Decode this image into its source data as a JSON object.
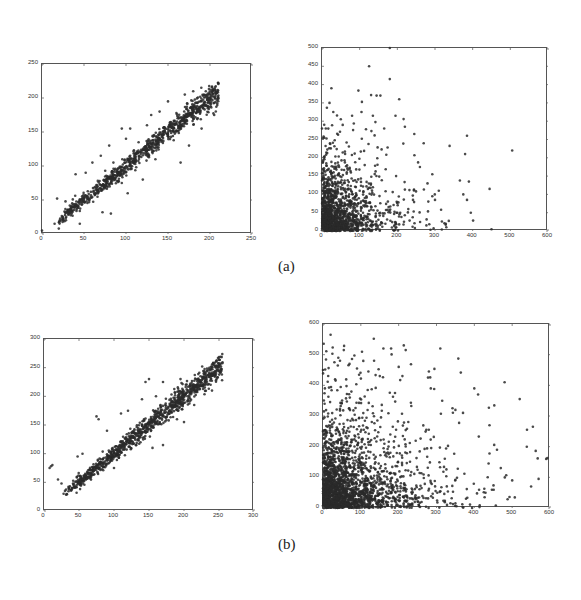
{
  "figure": {
    "captions": [
      "(a)",
      "(b)"
    ]
  },
  "chart_data": [
    {
      "id": "a-left",
      "type": "scatter",
      "title": "",
      "xlabel": "",
      "ylabel": "",
      "xlim": [
        0,
        250
      ],
      "ylim": [
        0,
        250
      ],
      "xticks": [
        0,
        50,
        100,
        150,
        200,
        250
      ],
      "yticks": [
        0,
        50,
        100,
        150,
        200,
        250
      ],
      "grid": false,
      "box": {
        "left": 41,
        "top": 63,
        "right": 251,
        "bottom": 233
      },
      "distribution": {
        "kind": "linear",
        "n": 900,
        "x_min": 20,
        "x_max": 210,
        "slope": 1.0,
        "intercept": 0,
        "noise": 6,
        "seed": 11
      },
      "outliers": [
        [
          0,
          5
        ],
        [
          15,
          15
        ],
        [
          20,
          8
        ],
        [
          18,
          52
        ],
        [
          28,
          48
        ],
        [
          40,
          88
        ],
        [
          45,
          15
        ],
        [
          52,
          90
        ],
        [
          60,
          105
        ],
        [
          70,
          115
        ],
        [
          72,
          32
        ],
        [
          80,
          130
        ],
        [
          82,
          30
        ],
        [
          85,
          105
        ],
        [
          95,
          75
        ],
        [
          95,
          155
        ],
        [
          100,
          140
        ],
        [
          102,
          60
        ],
        [
          105,
          155
        ],
        [
          115,
          135
        ],
        [
          120,
          80
        ],
        [
          125,
          160
        ],
        [
          135,
          110
        ],
        [
          130,
          175
        ],
        [
          140,
          180
        ],
        [
          150,
          195
        ],
        [
          165,
          105
        ],
        [
          170,
          205
        ],
        [
          175,
          130
        ],
        [
          180,
          210
        ],
        [
          190,
          155
        ],
        [
          195,
          210
        ],
        [
          205,
          175
        ],
        [
          210,
          200
        ]
      ]
    },
    {
      "id": "a-right",
      "type": "scatter",
      "title": "",
      "xlabel": "",
      "ylabel": "",
      "xlim": [
        0,
        600
      ],
      "ylim": [
        0,
        500
      ],
      "xticks": [
        0,
        100,
        200,
        300,
        400,
        500,
        600
      ],
      "yticks": [
        0,
        50,
        100,
        150,
        200,
        250,
        300,
        350,
        400,
        450,
        500
      ],
      "grid": false,
      "box": {
        "left": 321,
        "top": 47,
        "right": 547,
        "bottom": 230
      },
      "distribution": {
        "kind": "cluster",
        "n": 1400,
        "x_scale": 75,
        "y_scale": 80,
        "seed": 23
      },
      "outliers": [
        [
          0,
          280
        ],
        [
          10,
          280
        ],
        [
          20,
          350
        ],
        [
          25,
          390
        ],
        [
          30,
          325
        ],
        [
          55,
          290
        ],
        [
          80,
          315
        ],
        [
          105,
          325
        ],
        [
          125,
          450
        ],
        [
          135,
          315
        ],
        [
          145,
          370
        ],
        [
          155,
          370
        ],
        [
          165,
          280
        ],
        [
          180,
          415
        ],
        [
          180,
          500
        ],
        [
          195,
          315
        ],
        [
          205,
          360
        ],
        [
          220,
          285
        ],
        [
          245,
          265
        ],
        [
          260,
          175
        ],
        [
          270,
          240
        ],
        [
          280,
          130
        ],
        [
          300,
          85
        ],
        [
          310,
          110
        ],
        [
          330,
          10
        ],
        [
          375,
          100
        ],
        [
          380,
          210
        ],
        [
          385,
          260
        ],
        [
          385,
          85
        ],
        [
          390,
          135
        ],
        [
          395,
          50
        ],
        [
          445,
          115
        ],
        [
          450,
          5
        ],
        [
          505,
          220
        ]
      ]
    },
    {
      "id": "b-left",
      "type": "scatter",
      "title": "",
      "xlabel": "",
      "ylabel": "",
      "xlim": [
        0,
        300
      ],
      "ylim": [
        0,
        300
      ],
      "xticks": [
        0,
        50,
        100,
        150,
        200,
        250,
        300
      ],
      "yticks": [
        0,
        50,
        100,
        150,
        200,
        250,
        300
      ],
      "grid": false,
      "box": {
        "left": 43,
        "top": 338,
        "right": 253,
        "bottom": 510
      },
      "distribution": {
        "kind": "linear",
        "n": 1000,
        "x_min": 30,
        "x_max": 255,
        "slope": 1.0,
        "intercept": 0,
        "noise": 7,
        "seed": 37
      },
      "outliers": [
        [
          8,
          75
        ],
        [
          10,
          78
        ],
        [
          12,
          80
        ],
        [
          20,
          55
        ],
        [
          25,
          48
        ],
        [
          28,
          30
        ],
        [
          30,
          35
        ],
        [
          48,
          95
        ],
        [
          55,
          100
        ],
        [
          75,
          165
        ],
        [
          78,
          160
        ],
        [
          90,
          140
        ],
        [
          100,
          75
        ],
        [
          110,
          170
        ],
        [
          120,
          175
        ],
        [
          140,
          195
        ],
        [
          145,
          225
        ],
        [
          150,
          230
        ],
        [
          155,
          110
        ],
        [
          160,
          200
        ],
        [
          170,
          115
        ],
        [
          170,
          225
        ],
        [
          190,
          160
        ],
        [
          195,
          230
        ],
        [
          200,
          155
        ],
        [
          240,
          210
        ]
      ]
    },
    {
      "id": "b-right",
      "type": "scatter",
      "title": "",
      "xlabel": "",
      "ylabel": "",
      "xlim": [
        0,
        600
      ],
      "ylim": [
        0,
        600
      ],
      "xticks": [
        0,
        100,
        200,
        300,
        400,
        500,
        600
      ],
      "yticks": [
        0,
        100,
        200,
        300,
        400,
        500,
        600
      ],
      "grid": false,
      "box": {
        "left": 322,
        "top": 323,
        "right": 549,
        "bottom": 507
      },
      "distribution": {
        "kind": "cluster",
        "n": 2200,
        "x_scale": 110,
        "y_scale": 120,
        "seed": 53
      },
      "outliers": [
        [
          0,
          450
        ],
        [
          5,
          390
        ],
        [
          20,
          565
        ],
        [
          30,
          475
        ],
        [
          45,
          480
        ],
        [
          55,
          515
        ],
        [
          70,
          470
        ],
        [
          90,
          455
        ],
        [
          120,
          445
        ],
        [
          135,
          480
        ],
        [
          150,
          430
        ],
        [
          180,
          520
        ],
        [
          200,
          460
        ],
        [
          210,
          430
        ],
        [
          280,
          445
        ],
        [
          285,
          390
        ],
        [
          310,
          520
        ],
        [
          315,
          350
        ],
        [
          350,
          320
        ],
        [
          370,
          310
        ],
        [
          400,
          390
        ],
        [
          410,
          370
        ],
        [
          440,
          270
        ],
        [
          460,
          190
        ],
        [
          470,
          130
        ],
        [
          480,
          410
        ],
        [
          500,
          90
        ],
        [
          520,
          355
        ],
        [
          550,
          70
        ],
        [
          570,
          95
        ],
        [
          590,
          160
        ]
      ]
    }
  ]
}
